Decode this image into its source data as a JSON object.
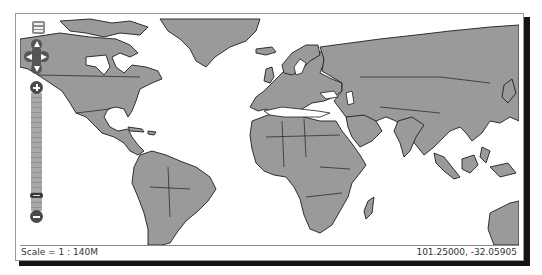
{
  "map": {
    "land_color": "#9a9a9a",
    "border_color": "#1e1e1e",
    "water_color": "#ffffff"
  },
  "controls": {
    "layer_switcher": {
      "icon": "layer-list-icon"
    },
    "pan": {
      "up": {
        "icon": "pan-up-arrow-icon"
      },
      "left": {
        "icon": "pan-left-arrow-icon"
      },
      "right": {
        "icon": "pan-right-arrow-icon"
      },
      "down": {
        "icon": "pan-down-arrow-icon"
      }
    },
    "zoom": {
      "in": {
        "icon": "plus-icon"
      },
      "out": {
        "icon": "minus-icon"
      },
      "levels": 16,
      "current_level": 2
    }
  },
  "status": {
    "scale": "Scale = 1 : 140M",
    "coordinates": "101.25000, -32.05905"
  }
}
